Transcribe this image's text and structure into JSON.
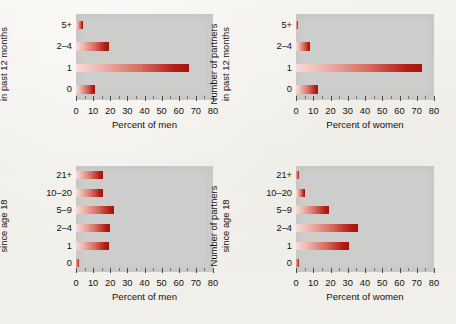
{
  "figure": {
    "background_color": "#f1efea",
    "plot_background_color": "#cdcdcb",
    "bar_color_light": "#f6dcd8",
    "bar_color_dark": "#a4140e"
  },
  "chart_data": [
    {
      "type": "bar",
      "orientation": "horizontal",
      "panel": "top-left",
      "title": "",
      "ylabel": "Number of partners in past 12 months",
      "ylabel_line1": "Number of partners",
      "ylabel_line2": "in past 12 months",
      "xlabel": "Percent of men",
      "categories": [
        "5+",
        "2–4",
        "1",
        "0"
      ],
      "values": [
        4,
        19,
        66,
        11
      ],
      "xlim": [
        0,
        80
      ],
      "xticks": [
        0,
        10,
        20,
        30,
        40,
        50,
        60,
        70,
        80
      ],
      "xticklabels": [
        "0",
        "10",
        "20",
        "30",
        "40",
        "50",
        "60",
        "70",
        "80"
      ],
      "minor_tick_step": 5,
      "grid": false,
      "legend": "none"
    },
    {
      "type": "bar",
      "orientation": "horizontal",
      "panel": "top-right",
      "title": "",
      "ylabel": "Number of partners in past 12 months",
      "ylabel_line1": "Number of partners",
      "ylabel_line2": "in past 12 months",
      "xlabel": "Percent of women",
      "categories": [
        "5+",
        "2–4",
        "1",
        "0"
      ],
      "values": [
        1,
        8,
        73,
        13
      ],
      "xlim": [
        0,
        80
      ],
      "xticks": [
        0,
        10,
        20,
        30,
        40,
        50,
        60,
        70,
        80
      ],
      "xticklabels": [
        "0",
        "10",
        "20",
        "30",
        "40",
        "50",
        "60",
        "70",
        "80"
      ],
      "minor_tick_step": 5,
      "grid": false,
      "legend": "none"
    },
    {
      "type": "bar",
      "orientation": "horizontal",
      "panel": "bottom-left",
      "title": "",
      "ylabel": "Number of partners since age 18",
      "ylabel_line1": "Number of partners",
      "ylabel_line2": "since age 18",
      "xlabel": "Percent of men",
      "categories": [
        "21+",
        "10–20",
        "5–9",
        "2–4",
        "1",
        "0"
      ],
      "values": [
        16,
        16,
        22,
        20,
        19,
        2
      ],
      "xlim": [
        0,
        80
      ],
      "xticks": [
        0,
        10,
        20,
        30,
        40,
        50,
        60,
        70,
        80
      ],
      "xticklabels": [
        "0",
        "10",
        "20",
        "30",
        "40",
        "50",
        "60",
        "70",
        "80"
      ],
      "minor_tick_step": 5,
      "grid": false,
      "legend": "none"
    },
    {
      "type": "bar",
      "orientation": "horizontal",
      "panel": "bottom-right",
      "title": "",
      "ylabel": "Number of partners since age 18",
      "ylabel_line1": "Number of partners",
      "ylabel_line2": "since age 18",
      "xlabel": "Percent of women",
      "categories": [
        "21+",
        "10–20",
        "5–9",
        "2–4",
        "1",
        "0"
      ],
      "values": [
        2,
        5,
        19,
        36,
        31,
        2
      ],
      "xlim": [
        0,
        80
      ],
      "xticks": [
        0,
        10,
        20,
        30,
        40,
        50,
        60,
        70,
        80
      ],
      "xticklabels": [
        "0",
        "10",
        "20",
        "30",
        "40",
        "50",
        "60",
        "70",
        "80"
      ],
      "minor_tick_step": 5,
      "grid": false,
      "legend": "none"
    }
  ]
}
